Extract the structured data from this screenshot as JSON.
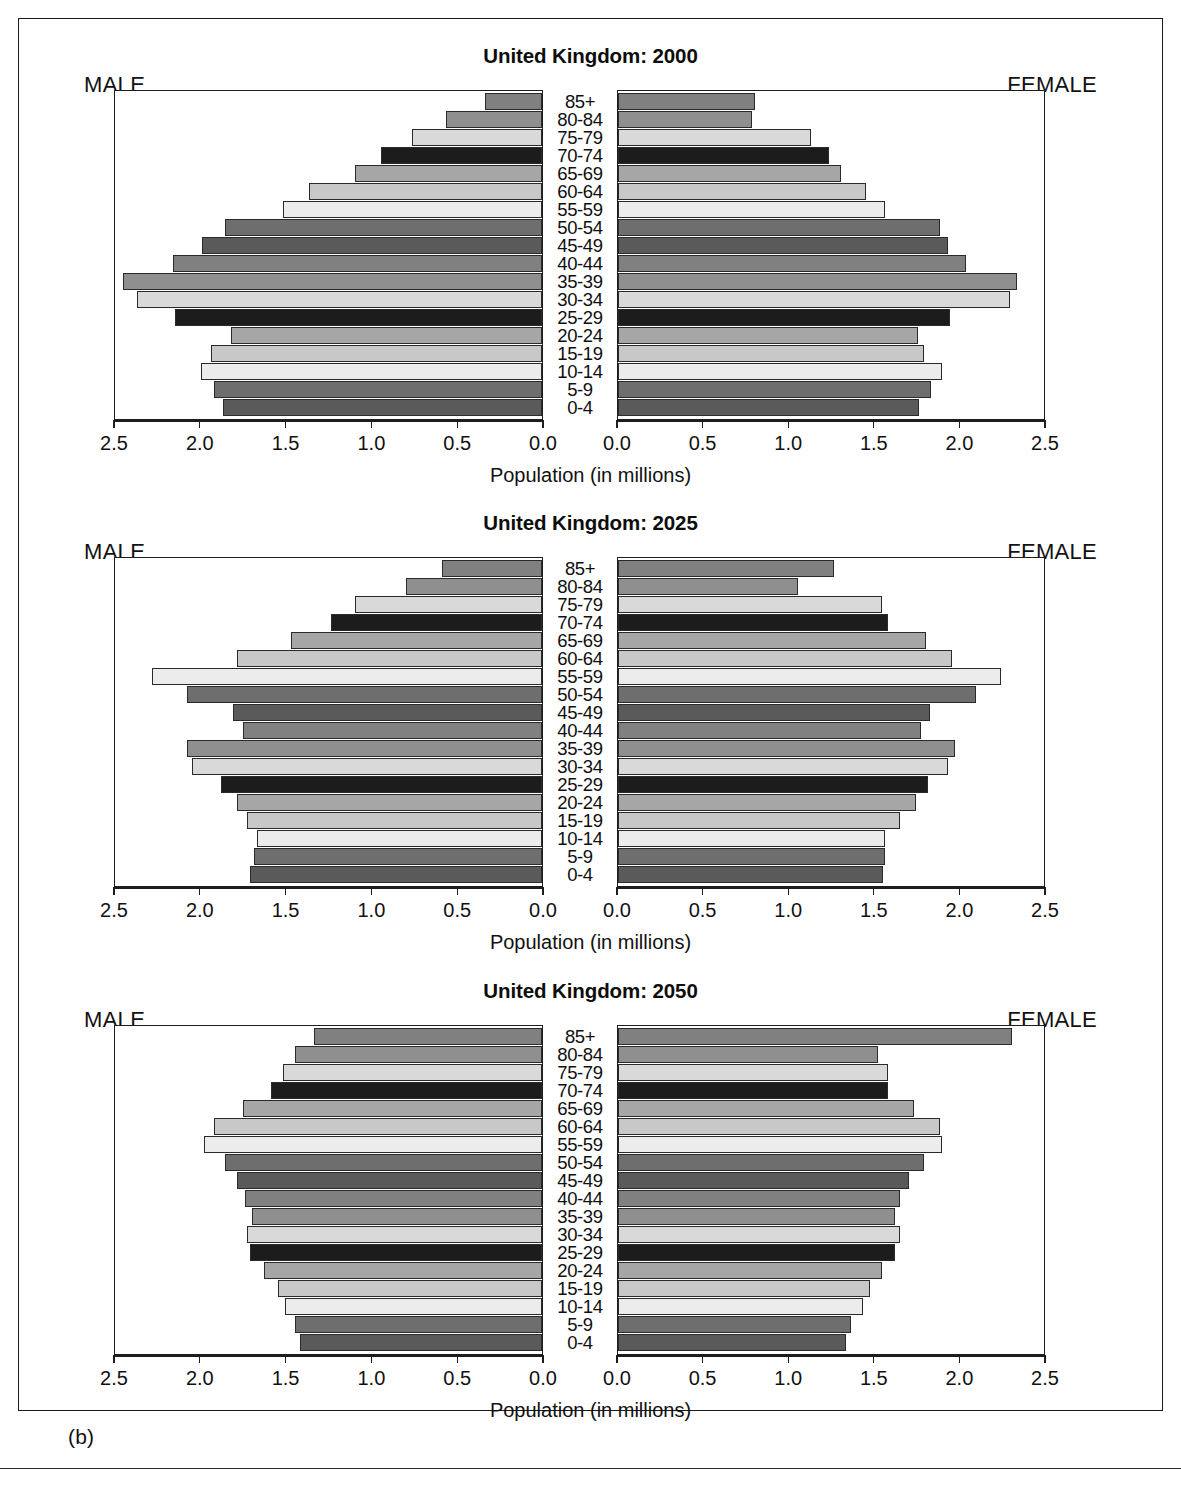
{
  "figure": {
    "caption_label": "(b)",
    "male_label": "MALE",
    "female_label": "FEMALE",
    "x_axis_title": "Population (in millions)",
    "tick_labels_left": [
      "2.5",
      "2.0",
      "1.5",
      "1.0",
      "0.5",
      "0.0"
    ],
    "tick_labels_right": [
      "0.0",
      "0.5",
      "1.0",
      "1.5",
      "2.0",
      "2.5"
    ],
    "age_groups": [
      "85+",
      "80-84",
      "75-79",
      "70-74",
      "65-69",
      "60-64",
      "55-59",
      "50-54",
      "45-49",
      "40-44",
      "35-39",
      "30-34",
      "25-29",
      "20-24",
      "15-19",
      "10-14",
      "5-9",
      "0-4"
    ],
    "axis_max": 2.5,
    "colors": {
      "line": "#1d1d1d",
      "text": "#111111",
      "background": "#ffffff"
    }
  },
  "chart_data": [
    {
      "type": "bar",
      "subtype": "population-pyramid",
      "title": "United Kingdom: 2000",
      "xlabel": "Population (in millions)",
      "ylabel": "",
      "xlim": [
        0,
        2.5
      ],
      "grid": false,
      "legend": "none",
      "categories": [
        "85+",
        "80-84",
        "75-79",
        "70-74",
        "65-69",
        "60-64",
        "55-59",
        "50-54",
        "45-49",
        "40-44",
        "35-39",
        "30-34",
        "25-29",
        "20-24",
        "15-19",
        "10-14",
        "5-9",
        "0-4"
      ],
      "series": [
        {
          "name": "MALE",
          "direction": "left",
          "values": [
            0.33,
            0.56,
            0.76,
            0.94,
            1.09,
            1.36,
            1.51,
            1.85,
            1.98,
            2.15,
            2.44,
            2.36,
            2.14,
            1.81,
            1.93,
            1.99,
            1.91,
            1.86
          ]
        },
        {
          "name": "FEMALE",
          "direction": "right",
          "values": [
            0.8,
            0.78,
            1.13,
            1.23,
            1.3,
            1.45,
            1.56,
            1.88,
            1.93,
            2.03,
            2.33,
            2.29,
            1.94,
            1.75,
            1.79,
            1.89,
            1.83,
            1.76
          ]
        }
      ]
    },
    {
      "type": "bar",
      "subtype": "population-pyramid",
      "title": "United Kingdom: 2025",
      "xlabel": "Population (in millions)",
      "ylabel": "",
      "xlim": [
        0,
        2.5
      ],
      "grid": false,
      "legend": "none",
      "categories": [
        "85+",
        "80-84",
        "75-79",
        "70-74",
        "65-69",
        "60-64",
        "55-59",
        "50-54",
        "45-49",
        "40-44",
        "35-39",
        "30-34",
        "25-29",
        "20-24",
        "15-19",
        "10-14",
        "5-9",
        "0-4"
      ],
      "series": [
        {
          "name": "MALE",
          "direction": "left",
          "values": [
            0.58,
            0.79,
            1.09,
            1.23,
            1.46,
            1.78,
            2.27,
            2.07,
            1.8,
            1.74,
            2.07,
            2.04,
            1.87,
            1.78,
            1.72,
            1.66,
            1.68,
            1.7
          ]
        },
        {
          "name": "FEMALE",
          "direction": "right",
          "values": [
            1.26,
            1.05,
            1.54,
            1.58,
            1.8,
            1.95,
            2.24,
            2.09,
            1.82,
            1.77,
            1.97,
            1.93,
            1.81,
            1.74,
            1.65,
            1.56,
            1.56,
            1.55
          ]
        }
      ]
    },
    {
      "type": "bar",
      "subtype": "population-pyramid",
      "title": "United Kingdom: 2050",
      "xlabel": "Population (in millions)",
      "ylabel": "",
      "xlim": [
        0,
        2.5
      ],
      "grid": false,
      "legend": "none",
      "categories": [
        "85+",
        "80-84",
        "75-79",
        "70-74",
        "65-69",
        "60-64",
        "55-59",
        "50-54",
        "45-49",
        "40-44",
        "35-39",
        "30-34",
        "25-29",
        "20-24",
        "15-19",
        "10-14",
        "5-9",
        "0-4"
      ],
      "series": [
        {
          "name": "MALE",
          "direction": "left",
          "values": [
            1.33,
            1.44,
            1.51,
            1.58,
            1.74,
            1.91,
            1.97,
            1.85,
            1.78,
            1.73,
            1.69,
            1.72,
            1.7,
            1.62,
            1.54,
            1.5,
            1.44,
            1.41
          ]
        },
        {
          "name": "FEMALE",
          "direction": "right",
          "values": [
            2.3,
            1.52,
            1.58,
            1.58,
            1.73,
            1.88,
            1.89,
            1.79,
            1.7,
            1.65,
            1.62,
            1.65,
            1.62,
            1.54,
            1.47,
            1.43,
            1.36,
            1.33
          ]
        }
      ]
    }
  ]
}
